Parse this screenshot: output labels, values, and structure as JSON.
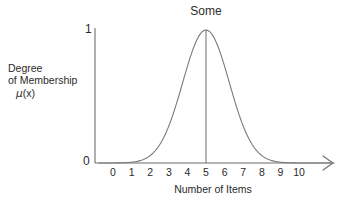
{
  "chart_data": {
    "type": "line",
    "title": "Some",
    "xlabel": "Number of Items",
    "ylabel": "Degree of Membership μ(x)",
    "ylabel_lines": [
      "Degree",
      "of Membership",
      "μ(x)"
    ],
    "ylabel_mu_prefix": "μ",
    "ylabel_mu_suffix": "(x)",
    "grid": false,
    "legend": "none",
    "xlim": [
      -0.75,
      11.9
    ],
    "ylim": [
      0,
      1.06
    ],
    "xticks": [
      "0",
      "1",
      "2",
      "3",
      "4",
      "5",
      "6",
      "7",
      "8",
      "9",
      "10"
    ],
    "yticks": [
      "0",
      "1"
    ],
    "curve_shape": "gaussian",
    "center": 5,
    "sigma": 1.25,
    "peak": 1,
    "peak_marker": "vertical line at x = 5 from axis to peak",
    "x": [
      0,
      0.5,
      1,
      1.5,
      2,
      2.5,
      3,
      3.5,
      4,
      4.5,
      5,
      5.5,
      6,
      6.5,
      7,
      7.5,
      8,
      8.5,
      9,
      9.5,
      10
    ],
    "values": [
      0.0,
      0.002,
      0.006,
      0.018,
      0.049,
      0.118,
      0.248,
      0.458,
      0.726,
      0.923,
      1.0,
      0.923,
      0.726,
      0.458,
      0.248,
      0.118,
      0.049,
      0.018,
      0.006,
      0.002,
      0.0
    ],
    "colors": {
      "curve": "#7a7a7a",
      "axis": "#6e6e6e",
      "text": "#2b2b2b",
      "background": "#ffffff"
    }
  }
}
